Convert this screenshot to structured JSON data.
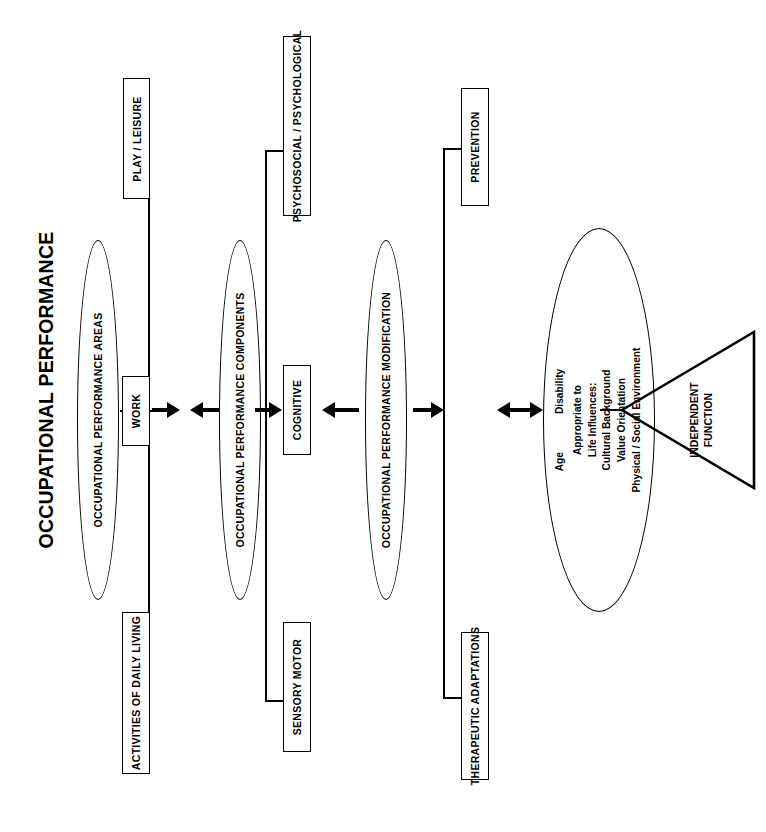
{
  "diagram": {
    "title": "OCCUPATIONAL PERFORMANCE",
    "type": "flow-diagram",
    "orientation": "rotated-90-ccw"
  },
  "stages": [
    {
      "id": "performance-areas",
      "ellipse_label": "OCCUPATIONAL PERFORMANCE AREAS",
      "boxes": [
        {
          "id": "play-leisure",
          "label": "PLAY / LEISURE"
        },
        {
          "id": "work",
          "label": "WORK"
        },
        {
          "id": "activities-of-daily-living",
          "label": "ACTIVITIES OF DAILY LIVING"
        }
      ]
    },
    {
      "id": "performance-components",
      "ellipse_label": "OCCUPATIONAL PERFORMANCE COMPONENTS",
      "boxes": [
        {
          "id": "psychosocial-psychological",
          "label": "PSYCHOSOCIAL / PSYCHOLOGICAL"
        },
        {
          "id": "cognitive",
          "label": "COGNITIVE"
        },
        {
          "id": "sensory-motor",
          "label": "SENSORY MOTOR"
        }
      ]
    },
    {
      "id": "performance-modification",
      "ellipse_label": "OCCUPATIONAL PERFORMANCE MODIFICATION",
      "boxes": [
        {
          "id": "prevention",
          "label": "PREVENTION"
        },
        {
          "id": "therapeutic-adaptations",
          "label": "THERAPEUTIC ADAPTATIONS"
        }
      ]
    }
  ],
  "outcome": {
    "id": "appropriateness",
    "line_top_left": "Age",
    "line_top_right": "Disability",
    "lines": [
      "Appropriate to",
      "Life Influences:",
      "Cultural Background",
      "Value Orientation",
      "Physical / Social Environment"
    ]
  },
  "result": {
    "id": "independent-function",
    "label_line1": "INDEPENDENT",
    "label_line2": "FUNCTION"
  },
  "colors": {
    "stroke": "#000000",
    "background": "#ffffff"
  }
}
